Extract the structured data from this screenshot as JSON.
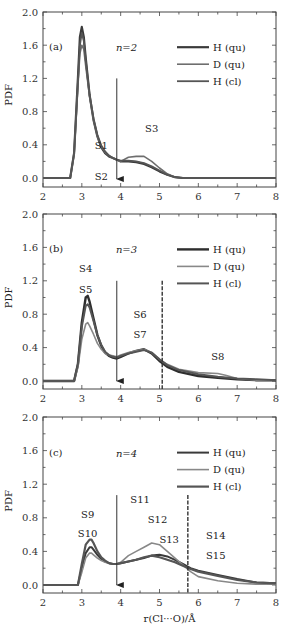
{
  "chart_data": [
    {
      "type": "line",
      "panel_label": "(a)",
      "annotation": "n=2",
      "xlabel": "",
      "ylabel": "PDF",
      "xlim": [
        2,
        8
      ],
      "ylim": [
        0,
        2.0
      ],
      "x_ticks": [
        "2",
        "3",
        "4",
        "5",
        "6",
        "7",
        "8"
      ],
      "y_ticks": [
        "0.0",
        "0.4",
        "0.8",
        "1.2",
        "1.6",
        "2.0"
      ],
      "legend": [
        "H (qu)",
        "D (qu)",
        "H (cl)"
      ],
      "legend_position": "top-right",
      "arrow": {
        "x": 3.9,
        "y_top": 1.2
      },
      "dashed_line": null,
      "labels": [
        {
          "text": "S1",
          "x": 3.5,
          "y": 0.4
        },
        {
          "text": "S2",
          "x": 3.5,
          "y": 0.03
        },
        {
          "text": "S3",
          "x": 4.8,
          "y": 0.6
        }
      ],
      "series": [
        {
          "name": "H (qu)",
          "color": "#3a3a3a",
          "width": 2.2,
          "x": [
            2,
            2.7,
            2.8,
            2.9,
            2.95,
            3.0,
            3.05,
            3.1,
            3.2,
            3.3,
            3.4,
            3.5,
            3.6,
            3.7,
            3.8,
            3.9,
            4.0,
            4.2,
            4.4,
            4.6,
            4.8,
            5.0,
            5.2,
            5.4,
            5.6,
            6,
            7,
            8
          ],
          "y": [
            0,
            0,
            0.3,
            1.2,
            1.7,
            1.82,
            1.7,
            1.45,
            1.0,
            0.7,
            0.5,
            0.37,
            0.3,
            0.26,
            0.24,
            0.22,
            0.2,
            0.2,
            0.19,
            0.17,
            0.13,
            0.08,
            0.04,
            0.01,
            0,
            0,
            0,
            0
          ]
        },
        {
          "name": "D (qu)",
          "color": "#6e6e6e",
          "width": 1.6,
          "x": [
            2,
            2.7,
            2.8,
            2.9,
            2.95,
            3.0,
            3.05,
            3.1,
            3.2,
            3.3,
            3.4,
            3.5,
            3.6,
            3.7,
            3.8,
            3.9,
            4.0,
            4.2,
            4.4,
            4.6,
            4.8,
            5.0,
            5.2,
            5.4,
            5.6,
            6,
            7,
            8
          ],
          "y": [
            0,
            0,
            0.28,
            1.1,
            1.5,
            1.6,
            1.55,
            1.35,
            0.98,
            0.7,
            0.5,
            0.38,
            0.31,
            0.27,
            0.24,
            0.22,
            0.2,
            0.25,
            0.26,
            0.26,
            0.2,
            0.12,
            0.05,
            0.01,
            0,
            0,
            0,
            0
          ]
        },
        {
          "name": "H (cl)",
          "color": "#555555",
          "width": 1.8,
          "x": [
            2,
            2.7,
            2.8,
            2.9,
            2.95,
            3.0,
            3.05,
            3.1,
            3.2,
            3.3,
            3.4,
            3.5,
            3.6,
            3.7,
            3.8,
            3.9,
            4.0,
            4.2,
            4.4,
            4.6,
            4.8,
            5.0,
            5.2,
            5.4,
            5.6,
            6,
            7,
            8
          ],
          "y": [
            0,
            0,
            0.3,
            1.15,
            1.6,
            1.75,
            1.65,
            1.42,
            1.0,
            0.72,
            0.52,
            0.39,
            0.32,
            0.27,
            0.24,
            0.22,
            0.21,
            0.21,
            0.2,
            0.18,
            0.14,
            0.09,
            0.04,
            0.01,
            0,
            0,
            0,
            0
          ]
        }
      ]
    },
    {
      "type": "line",
      "panel_label": "(b)",
      "annotation": "n=3",
      "xlabel": "",
      "ylabel": "PDF",
      "xlim": [
        2,
        8
      ],
      "ylim": [
        0,
        2.0
      ],
      "x_ticks": [
        "2",
        "3",
        "4",
        "5",
        "6",
        "7",
        "8"
      ],
      "y_ticks": [
        "0.0",
        "0.4",
        "0.8",
        "1.2",
        "1.6",
        "2.0"
      ],
      "legend": [
        "H (qu)",
        "D (qu)",
        "H (cl)"
      ],
      "legend_position": "top-right",
      "arrow": {
        "x": 3.9,
        "y_top": 1.2
      },
      "dashed_line": {
        "x": 5.07,
        "y_top": 1.2
      },
      "labels": [
        {
          "text": "S4",
          "x": 3.1,
          "y": 1.35
        },
        {
          "text": "S5",
          "x": 3.1,
          "y": 1.1
        },
        {
          "text": "S6",
          "x": 4.5,
          "y": 0.8
        },
        {
          "text": "S7",
          "x": 4.5,
          "y": 0.56
        },
        {
          "text": "S8",
          "x": 6.5,
          "y": 0.3
        }
      ],
      "series": [
        {
          "name": "H (qu)",
          "color": "#2e2e2e",
          "width": 2.4,
          "x": [
            2,
            2.8,
            2.9,
            3.0,
            3.1,
            3.15,
            3.2,
            3.3,
            3.4,
            3.5,
            3.6,
            3.7,
            3.8,
            3.9,
            4.0,
            4.2,
            4.4,
            4.6,
            4.8,
            5.0,
            5.2,
            5.5,
            6.0,
            6.5,
            7.0,
            7.5,
            8
          ],
          "y": [
            0,
            0,
            0.2,
            0.7,
            1.0,
            1.02,
            0.95,
            0.75,
            0.55,
            0.42,
            0.34,
            0.3,
            0.28,
            0.27,
            0.29,
            0.33,
            0.36,
            0.38,
            0.33,
            0.24,
            0.17,
            0.11,
            0.06,
            0.04,
            0.02,
            0.01,
            0.01
          ]
        },
        {
          "name": "D (qu)",
          "color": "#888888",
          "width": 1.6,
          "x": [
            2,
            2.8,
            2.9,
            3.0,
            3.1,
            3.15,
            3.2,
            3.3,
            3.4,
            3.5,
            3.6,
            3.7,
            3.8,
            3.9,
            4.0,
            4.2,
            4.4,
            4.6,
            4.8,
            5.0,
            5.2,
            5.5,
            6.0,
            6.5,
            6.7,
            7.0,
            7.5,
            8
          ],
          "y": [
            0,
            0,
            0.16,
            0.5,
            0.68,
            0.7,
            0.66,
            0.56,
            0.45,
            0.38,
            0.33,
            0.31,
            0.3,
            0.29,
            0.31,
            0.34,
            0.36,
            0.38,
            0.34,
            0.26,
            0.2,
            0.14,
            0.1,
            0.09,
            0.07,
            0.03,
            0.01,
            0.01
          ]
        },
        {
          "name": "H (cl)",
          "color": "#555555",
          "width": 2.0,
          "x": [
            2,
            2.8,
            2.9,
            3.0,
            3.1,
            3.15,
            3.2,
            3.3,
            3.4,
            3.5,
            3.6,
            3.7,
            3.8,
            3.9,
            4.0,
            4.2,
            4.4,
            4.6,
            4.8,
            5.0,
            5.2,
            5.5,
            6.0,
            6.5,
            7.0,
            7.5,
            8
          ],
          "y": [
            0,
            0,
            0.2,
            0.65,
            0.9,
            0.92,
            0.88,
            0.72,
            0.55,
            0.43,
            0.35,
            0.31,
            0.29,
            0.28,
            0.3,
            0.33,
            0.35,
            0.37,
            0.34,
            0.26,
            0.19,
            0.13,
            0.08,
            0.05,
            0.03,
            0.02,
            0.01
          ]
        }
      ]
    },
    {
      "type": "line",
      "panel_label": "(c)",
      "annotation": "n=4",
      "xlabel": "r(Cl···O)/Å",
      "ylabel": "PDF",
      "xlim": [
        2,
        8
      ],
      "ylim": [
        0,
        2.0
      ],
      "x_ticks": [
        "2",
        "3",
        "4",
        "5",
        "6",
        "7",
        "8"
      ],
      "y_ticks": [
        "0.0",
        "0.4",
        "0.8",
        "1.2",
        "1.6",
        "2.0"
      ],
      "legend": [
        "H (qu)",
        "D (qu)",
        "H (cl)"
      ],
      "legend_position": "top-right",
      "arrow": {
        "x": 3.9,
        "y_top": 1.07
      },
      "dashed_line": {
        "x": 5.73,
        "y_top": 1.07
      },
      "labels": [
        {
          "text": "S9",
          "x": 3.15,
          "y": 0.85
        },
        {
          "text": "S10",
          "x": 3.15,
          "y": 0.62
        },
        {
          "text": "S11",
          "x": 4.5,
          "y": 1.02
        },
        {
          "text": "S12",
          "x": 4.95,
          "y": 0.78
        },
        {
          "text": "S13",
          "x": 5.25,
          "y": 0.55
        },
        {
          "text": "S14",
          "x": 6.45,
          "y": 0.6
        },
        {
          "text": "S15",
          "x": 6.45,
          "y": 0.36
        }
      ],
      "series": [
        {
          "name": "H (qu)",
          "color": "#3a3a3a",
          "width": 2.0,
          "x": [
            2,
            2.9,
            3.0,
            3.1,
            3.2,
            3.25,
            3.3,
            3.4,
            3.5,
            3.6,
            3.7,
            3.8,
            3.9,
            4.0,
            4.2,
            4.4,
            4.6,
            4.8,
            5.0,
            5.2,
            5.4,
            5.6,
            5.8,
            6.0,
            6.5,
            7.0,
            7.5,
            8
          ],
          "y": [
            0,
            0,
            0.2,
            0.38,
            0.45,
            0.45,
            0.42,
            0.36,
            0.31,
            0.28,
            0.26,
            0.25,
            0.25,
            0.26,
            0.28,
            0.3,
            0.32,
            0.35,
            0.36,
            0.34,
            0.3,
            0.25,
            0.2,
            0.17,
            0.12,
            0.07,
            0.03,
            0.02
          ]
        },
        {
          "name": "D (qu)",
          "color": "#888888",
          "width": 1.6,
          "x": [
            2,
            2.9,
            3.0,
            3.1,
            3.2,
            3.25,
            3.3,
            3.4,
            3.5,
            3.6,
            3.7,
            3.8,
            3.9,
            4.0,
            4.2,
            4.4,
            4.6,
            4.8,
            5.0,
            5.2,
            5.4,
            5.6,
            5.8,
            6.0,
            6.5,
            7.0,
            7.5,
            8
          ],
          "y": [
            0,
            0,
            0.15,
            0.32,
            0.38,
            0.38,
            0.36,
            0.32,
            0.29,
            0.27,
            0.26,
            0.25,
            0.25,
            0.27,
            0.35,
            0.4,
            0.45,
            0.5,
            0.48,
            0.4,
            0.32,
            0.24,
            0.16,
            0.1,
            0.05,
            0.02,
            0.01,
            0.01
          ]
        },
        {
          "name": "H (cl)",
          "color": "#555555",
          "width": 2.2,
          "x": [
            2,
            2.9,
            3.0,
            3.1,
            3.2,
            3.25,
            3.3,
            3.4,
            3.5,
            3.6,
            3.7,
            3.8,
            3.9,
            4.0,
            4.2,
            4.4,
            4.6,
            4.8,
            5.0,
            5.2,
            5.4,
            5.6,
            5.8,
            6.0,
            6.5,
            7.0,
            7.5,
            8
          ],
          "y": [
            0,
            0,
            0.25,
            0.48,
            0.54,
            0.54,
            0.5,
            0.4,
            0.33,
            0.29,
            0.26,
            0.25,
            0.25,
            0.26,
            0.28,
            0.3,
            0.33,
            0.35,
            0.33,
            0.3,
            0.27,
            0.23,
            0.19,
            0.16,
            0.11,
            0.06,
            0.03,
            0.02
          ]
        }
      ]
    }
  ]
}
